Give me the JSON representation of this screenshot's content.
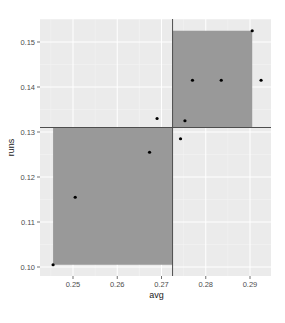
{
  "chart_data": {
    "type": "scatter",
    "title": "",
    "xlabel": "avg",
    "ylabel": "runs",
    "xlim": [
      0.2435,
      0.2945
    ],
    "ylim": [
      0.0985,
      0.1545
    ],
    "x_ticks": [
      0.25,
      0.26,
      0.27,
      0.28,
      0.29
    ],
    "x_tick_labels": [
      "0.25",
      "0.26",
      "0.27",
      "0.28",
      "0.29"
    ],
    "y_ticks": [
      0.1,
      0.11,
      0.12,
      0.13,
      0.14,
      0.15
    ],
    "y_tick_labels": [
      "0.10",
      "0.11",
      "0.12",
      "0.13",
      "0.14",
      "0.15"
    ],
    "grid": true,
    "legend": "none",
    "points": [
      {
        "x": 0.2455,
        "y": 0.1005
      },
      {
        "x": 0.2505,
        "y": 0.1155
      },
      {
        "x": 0.2673,
        "y": 0.1255
      },
      {
        "x": 0.269,
        "y": 0.133
      },
      {
        "x": 0.2743,
        "y": 0.1285
      },
      {
        "x": 0.2753,
        "y": 0.1325
      },
      {
        "x": 0.277,
        "y": 0.1415
      },
      {
        "x": 0.2835,
        "y": 0.1415
      },
      {
        "x": 0.2905,
        "y": 0.1525
      },
      {
        "x": 0.2925,
        "y": 0.1415
      }
    ],
    "reference_lines": {
      "vertical_x": 0.2725,
      "horizontal_y": 0.131
    },
    "shaded_rects": [
      {
        "xmin": 0.2455,
        "xmax": 0.2725,
        "ymin": 0.1005,
        "ymax": 0.131
      },
      {
        "xmin": 0.2725,
        "xmax": 0.2905,
        "ymin": 0.131,
        "ymax": 0.1525
      }
    ]
  },
  "colors": {
    "panel_bg": "#ebebeb",
    "grid_major": "#ffffff",
    "rect_fill": "#999999",
    "line": "#4d4d4d",
    "point": "#000000"
  }
}
